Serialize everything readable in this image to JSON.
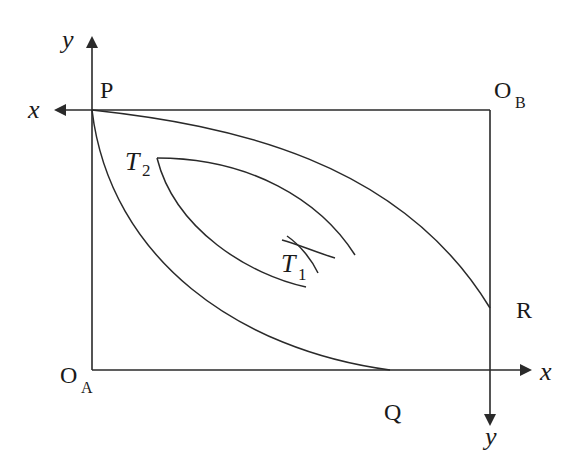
{
  "diagram": {
    "labels": {
      "origin_a": "O",
      "origin_a_sub": "A",
      "origin_b": "O",
      "origin_b_sub": "B",
      "point_p": "P",
      "point_q": "Q",
      "point_r": "R",
      "t1": "T",
      "t1_sub": "1",
      "t2": "T",
      "t2_sub": "2",
      "axis_a_x": "x",
      "axis_a_y": "y",
      "axis_b_x": "x",
      "axis_b_y": "y"
    },
    "colors": {
      "stroke": "#2a2a2a",
      "background": "#ffffff"
    }
  }
}
